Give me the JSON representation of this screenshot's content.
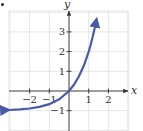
{
  "figure": {
    "label_marker": "•"
  },
  "chart_data": {
    "type": "line",
    "title": "",
    "function": "y = 3^x - 1",
    "xlabel": "x",
    "ylabel": "y",
    "xlim": [
      -3,
      3
    ],
    "ylim": [
      -2,
      4
    ],
    "x_ticks": [
      -2,
      -1,
      1,
      2
    ],
    "x_tick_labels": [
      "−2",
      "−1",
      "1",
      "2"
    ],
    "y_ticks": [
      -1,
      1,
      2,
      3
    ],
    "y_tick_labels": [
      "−1",
      "1",
      "2",
      "3"
    ],
    "grid": true,
    "legend": null,
    "asymptote": {
      "type": "horizontal",
      "y": -1
    },
    "series": [
      {
        "name": "curve",
        "x": [
          -3.05,
          -2.5,
          -2,
          -1.5,
          -1,
          -0.5,
          0,
          0.25,
          0.5,
          0.75,
          1,
          1.1,
          1.2,
          1.3,
          1.4
        ],
        "y": [
          -0.965,
          -0.936,
          -0.889,
          -0.808,
          -0.667,
          -0.423,
          0,
          0.316,
          0.732,
          1.28,
          2.0,
          2.348,
          2.737,
          3.172,
          3.657
        ],
        "arrows": "both"
      }
    ],
    "colors": {
      "curve": "#4a5aa8",
      "grid": "#e0e0e0",
      "axes": "#333333"
    }
  }
}
